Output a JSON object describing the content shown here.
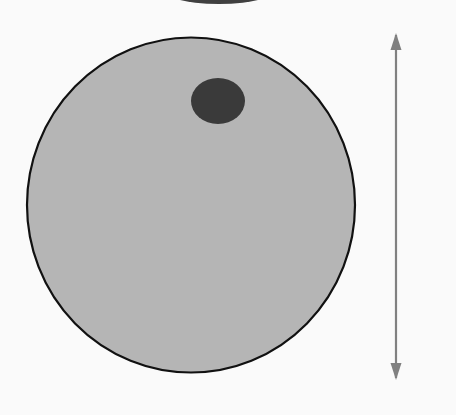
{
  "figure": {
    "background_color": "#fafafa"
  },
  "ball": {
    "name": "beach-ball",
    "center_x": 191,
    "center_y": 205,
    "radius_x": 164,
    "radius_y": 167.5,
    "outline_color": "#111111",
    "outline_width": 2.2,
    "hub": {
      "label": "center-hub",
      "center_x": 218,
      "center_y": 101,
      "radius_x": 27,
      "radius_y": 23,
      "color": "#3a3a3a"
    },
    "palette": {
      "light": "#c9c9c9",
      "light_alt": "#d2d2d2",
      "medium": "#a3a3a3",
      "medium_alt": "#9a9a9a",
      "dark": "#6e6e6e",
      "dark_alt": "#787878",
      "hub": "#3a3a3a"
    },
    "segment_count": 16,
    "segments": [
      {
        "index": 0,
        "tone": "dark",
        "color": "#6e6e6e",
        "start_angle": -96,
        "end_angle": -72
      },
      {
        "index": 1,
        "tone": "medium",
        "color": "#a3a3a3",
        "start_angle": -72,
        "end_angle": -50
      },
      {
        "index": 2,
        "tone": "light",
        "color": "#c9c9c9",
        "start_angle": -50,
        "end_angle": -30
      },
      {
        "index": 3,
        "tone": "dark",
        "color": "#6e6e6e",
        "start_angle": -30,
        "end_angle": -8
      },
      {
        "index": 4,
        "tone": "medium",
        "color": "#9a9a9a",
        "start_angle": -8,
        "end_angle": 14
      },
      {
        "index": 5,
        "tone": "light",
        "color": "#c9c9c9",
        "start_angle": 14,
        "end_angle": 34
      },
      {
        "index": 6,
        "tone": "dark",
        "color": "#787878",
        "start_angle": 34,
        "end_angle": 54
      },
      {
        "index": 7,
        "tone": "light",
        "color": "#d2d2d2",
        "start_angle": 54,
        "end_angle": 72
      },
      {
        "index": 8,
        "tone": "medium",
        "color": "#a3a3a3",
        "start_angle": 72,
        "end_angle": 92
      },
      {
        "index": 9,
        "tone": "light",
        "color": "#c9c9c9",
        "start_angle": 92,
        "end_angle": 112
      },
      {
        "index": 10,
        "tone": "dark",
        "color": "#6e6e6e",
        "start_angle": 112,
        "end_angle": 133
      },
      {
        "index": 11,
        "tone": "medium",
        "color": "#a3a3a3",
        "start_angle": 133,
        "end_angle": 152
      },
      {
        "index": 12,
        "tone": "light",
        "color": "#c9c9c9",
        "start_angle": 152,
        "end_angle": 172
      },
      {
        "index": 13,
        "tone": "dark",
        "color": "#6e6e6e",
        "start_angle": 172,
        "end_angle": 196
      },
      {
        "index": 14,
        "tone": "light",
        "color": "#d2d2d2",
        "start_angle": 196,
        "end_angle": 222
      },
      {
        "index": 15,
        "tone": "medium",
        "color": "#a3a3a3",
        "start_angle": 222,
        "end_angle": 264
      }
    ]
  },
  "dimension": {
    "label": "40 cm",
    "value": 40,
    "unit": "cm",
    "line_x": 396,
    "top_y": 35,
    "bottom_y": 378,
    "color": "#808080",
    "measures": "diameter"
  },
  "top_fragment": {
    "name": "cropped-arc-above",
    "center_x": 219,
    "center_y": -14,
    "radius_x": 62,
    "radius_y": 18,
    "color": "#262626"
  }
}
